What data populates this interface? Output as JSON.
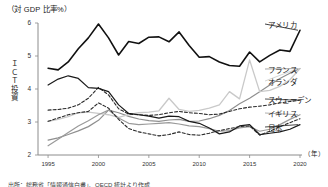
{
  "chart_data": {
    "type": "line",
    "title": "（対 GDP 比率%）",
    "ylabel": "ＩＣＴ投資",
    "ylabel_chars": [
      "Ｉ",
      "Ｃ",
      "Ｔ",
      "投",
      "資"
    ],
    "xlabel": "（年）",
    "xlim": [
      1994,
      2020
    ],
    "ylim": [
      2,
      6
    ],
    "yticks": [
      "6",
      "5",
      "4",
      "3",
      "2"
    ],
    "ytick_values": [
      6,
      5,
      4,
      3,
      2
    ],
    "xticks": [
      "1995",
      "2000",
      "2005",
      "2010",
      "2015",
      "2020"
    ],
    "xtick_values": [
      1995,
      2000,
      2005,
      2010,
      2015,
      2020
    ],
    "grid": false,
    "legend_position": "inline-right",
    "x": [
      1995,
      1996,
      1997,
      1998,
      1999,
      2000,
      2001,
      2002,
      2003,
      2004,
      2005,
      2006,
      2007,
      2008,
      2009,
      2010,
      2011,
      2012,
      2013,
      2014,
      2015,
      2016,
      2017,
      2018,
      2019,
      2020
    ],
    "series": [
      {
        "name": "アメリカ",
        "color": "#111111",
        "style": "solid",
        "width": 1.6,
        "label_x": 268,
        "label_y": 19,
        "values": [
          4.63,
          4.58,
          4.82,
          5.22,
          5.55,
          5.97,
          5.55,
          5.03,
          5.44,
          5.38,
          5.57,
          5.58,
          5.43,
          5.73,
          5.32,
          4.96,
          4.98,
          4.82,
          4.71,
          4.69,
          5.12,
          4.82,
          5.02,
          5.18,
          5.14,
          5.78
        ]
      },
      {
        "name": "フランス",
        "color": "#8f8f8f",
        "style": "solid",
        "width": 1.2,
        "label_x": 268,
        "label_y": 64,
        "values": [
          2.45,
          2.52,
          2.62,
          2.73,
          2.86,
          3.05,
          3.36,
          3.28,
          3.17,
          3.09,
          3.04,
          3.02,
          3.06,
          3.08,
          3.02,
          3.03,
          3.1,
          3.2,
          3.35,
          3.55,
          3.72,
          3.92,
          4.12,
          4.32,
          4.48,
          4.62
        ]
      },
      {
        "name": "オランダ",
        "color": "#c9c9c9",
        "style": "solid",
        "width": 1.3,
        "label_x": 268,
        "label_y": 76,
        "values": [
          3.02,
          3.08,
          3.16,
          3.28,
          3.3,
          3.26,
          3.22,
          3.14,
          3.22,
          3.28,
          3.3,
          3.34,
          3.72,
          3.38,
          3.32,
          3.35,
          3.42,
          3.52,
          3.92,
          3.7,
          4.88,
          3.92,
          3.96,
          4.08,
          4.28,
          4.62
        ]
      },
      {
        "name": "スウェーデン",
        "color": "#2b2b2b",
        "style": "dashed",
        "width": 1.1,
        "label_x": 268,
        "label_y": 94,
        "values": [
          3.36,
          3.38,
          3.42,
          3.52,
          3.72,
          4.05,
          3.82,
          3.4,
          3.24,
          3.22,
          3.2,
          3.22,
          3.28,
          3.32,
          3.28,
          3.26,
          3.22,
          3.24,
          3.32,
          3.4,
          3.45,
          3.48,
          3.52,
          3.58,
          3.62,
          3.66
        ]
      },
      {
        "name": "イギリス",
        "color": "#9a9a9a",
        "style": "solid",
        "width": 1.2,
        "label_x": 268,
        "label_y": 108,
        "values": [
          2.28,
          2.48,
          2.68,
          2.88,
          3.04,
          3.22,
          3.36,
          3.12,
          2.96,
          2.92,
          2.94,
          2.96,
          2.98,
          2.94,
          2.88,
          2.86,
          2.8,
          2.72,
          2.74,
          2.82,
          2.86,
          2.72,
          2.78,
          2.92,
          3.08,
          3.22
        ]
      },
      {
        "name": "日本",
        "color": "#1a1a1a",
        "style": "solid",
        "width": 1.2,
        "label_x": 268,
        "label_y": 122,
        "values": [
          4.12,
          4.3,
          4.4,
          4.32,
          4.04,
          4.02,
          3.92,
          3.52,
          3.26,
          3.22,
          3.18,
          3.12,
          3.18,
          3.16,
          3.02,
          2.96,
          2.82,
          2.64,
          2.7,
          2.88,
          2.92,
          2.62,
          2.66,
          2.7,
          2.78,
          2.92
        ]
      },
      {
        "name": "日本-dashed",
        "color": "#2b2b2b",
        "style": "dashed",
        "width": 1.1,
        "hidden_label": true,
        "values": [
          3.02,
          3.12,
          3.22,
          3.28,
          3.32,
          3.58,
          3.42,
          3.08,
          2.8,
          2.7,
          2.64,
          2.58,
          2.62,
          2.7,
          2.62,
          2.6,
          2.66,
          2.74,
          2.8,
          2.86,
          2.88,
          2.6,
          2.72,
          2.86,
          2.98,
          3.1
        ]
      }
    ]
  },
  "axis": {
    "title": "（対 GDP 比率%）",
    "y_title_chars": [
      "Ｉ",
      "Ｃ",
      "Ｔ",
      "投",
      "資"
    ],
    "x_unit": "（年）"
  },
  "source": {
    "note": "出所：総務省「情報通信白書」、OECD 統計より作成"
  }
}
